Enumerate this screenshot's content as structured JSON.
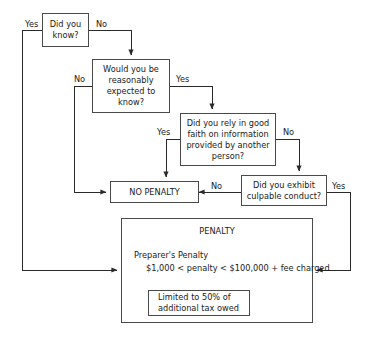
{
  "diagram": {
    "stroke_color": "#4a4a4a",
    "text_color": "#1a1a1a",
    "background_color": "#ffffff"
  },
  "nodes": {
    "did_you_know": "Did you\nknow?",
    "reasonably_expected": "Would you be\nreasonably\nexpected to\nknow?",
    "good_faith": "Did you rely in good\nfaith on information\nprovided by another\nperson?",
    "culpable_conduct": "Did you exhibit\nculpable conduct?",
    "no_penalty": "NO PENALTY",
    "limited": "Limited to 50% of\nadditional tax owed"
  },
  "penalty_group": {
    "title": "PENALTY",
    "line_1": "Preparer's Penalty",
    "line_2": "$1,000 < penalty < $100,000 + fee charged"
  },
  "edge_labels": {
    "know_yes": "Yes",
    "know_no": "No",
    "expected_no": "No",
    "expected_yes": "Yes",
    "good_faith_yes": "Yes",
    "good_faith_no": "No",
    "culpable_no": "No",
    "culpable_yes": "Yes"
  }
}
